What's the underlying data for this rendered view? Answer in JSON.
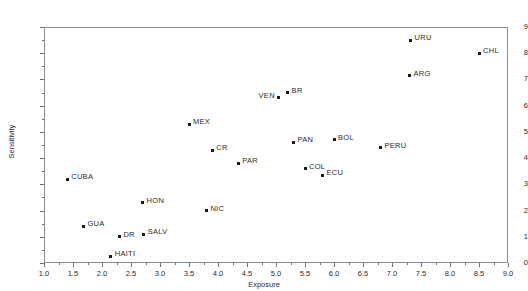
{
  "chart_data": {
    "type": "scatter",
    "title": "",
    "xlabel": "Exposure",
    "ylabel": "Sensitivity",
    "xlim": [
      1.0,
      9.0
    ],
    "ylim": [
      0,
      9
    ],
    "grid": false,
    "legend": null,
    "xticks": [
      "1.0",
      "1.5",
      "2.0",
      "2.5",
      "3.0",
      "3.5",
      "4.0",
      "4.5",
      "5.0",
      "5.5",
      "6.0",
      "6.5",
      "7.0",
      "7.5",
      "8.0",
      "8.5",
      "9.0"
    ],
    "xtick_values": [
      1.0,
      1.5,
      2.0,
      2.5,
      3.0,
      3.5,
      4.0,
      4.5,
      5.0,
      5.5,
      6.0,
      6.5,
      7.0,
      7.5,
      8.0,
      8.5,
      9.0
    ],
    "yticks": [
      "0",
      "1",
      "2",
      "3",
      "4",
      "5",
      "6",
      "7",
      "8",
      "9"
    ],
    "ytick_values": [
      0,
      1,
      2,
      3,
      4,
      5,
      6,
      7,
      8,
      9
    ],
    "marker_color": "#1a1a1a",
    "points": [
      {
        "label": "CUBA",
        "x": 1.4,
        "y": 3.2,
        "label_pos": "right"
      },
      {
        "label": "GUA",
        "x": 1.68,
        "y": 1.4,
        "label_pos": "right"
      },
      {
        "label": "HAITI",
        "x": 2.15,
        "y": 0.25,
        "label_pos": "right"
      },
      {
        "label": "DR",
        "x": 2.3,
        "y": 1.0,
        "label_pos": "right"
      },
      {
        "label": "HON",
        "x": 2.7,
        "y": 2.3,
        "label_pos": "right"
      },
      {
        "label": "SALV",
        "x": 2.72,
        "y": 1.1,
        "label_pos": "right"
      },
      {
        "label": "MEX",
        "x": 3.5,
        "y": 5.3,
        "label_pos": "right"
      },
      {
        "label": "NIC",
        "x": 3.8,
        "y": 2.0,
        "label_pos": "right"
      },
      {
        "label": "CR",
        "x": 3.9,
        "y": 4.3,
        "label_pos": "right"
      },
      {
        "label": "PAR",
        "x": 4.35,
        "y": 3.8,
        "label_pos": "right"
      },
      {
        "label": "VEN",
        "x": 5.05,
        "y": 6.3,
        "label_pos": "left"
      },
      {
        "label": "BR",
        "x": 5.2,
        "y": 6.5,
        "label_pos": "right"
      },
      {
        "label": "PAN",
        "x": 5.3,
        "y": 4.6,
        "label_pos": "right"
      },
      {
        "label": "COL",
        "x": 5.5,
        "y": 3.6,
        "label_pos": "right"
      },
      {
        "label": "ECU",
        "x": 5.8,
        "y": 3.35,
        "label_pos": "right"
      },
      {
        "label": "BOL",
        "x": 6.0,
        "y": 4.7,
        "label_pos": "right"
      },
      {
        "label": "PERU",
        "x": 6.8,
        "y": 4.4,
        "label_pos": "right"
      },
      {
        "label": "ARG",
        "x": 7.3,
        "y": 7.15,
        "label_pos": "right"
      },
      {
        "label": "URU",
        "x": 7.32,
        "y": 8.5,
        "label_pos": "right"
      },
      {
        "label": "CHL",
        "x": 8.5,
        "y": 8.0,
        "label_pos": "right"
      }
    ]
  }
}
